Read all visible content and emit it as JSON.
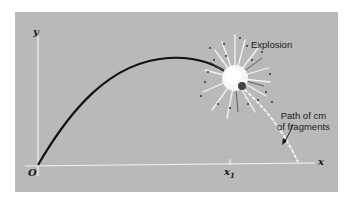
{
  "diagram": {
    "axes": {
      "x_label": "x",
      "y_label": "y",
      "origin_label": "O",
      "tick_label": "x",
      "tick_subscript": "1"
    },
    "annotations": {
      "explosion": "Explosion",
      "path_line1": "Path of cm",
      "path_line2": "of fragments"
    },
    "colors": {
      "background": "#b9b9b9",
      "trajectory": "#111111",
      "axes": "#f2f2f2",
      "cm_path": "#f5f5f5"
    }
  }
}
